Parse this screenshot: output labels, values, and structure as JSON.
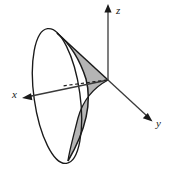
{
  "figure": {
    "background_color": "#ffffff",
    "stroke_color": "#1a1a1a",
    "shade_fill_color": "#b5b5b5",
    "axes": [
      {
        "id": "z",
        "label": "z",
        "direction": "up",
        "origin": [
          108,
          80
        ],
        "tip": [
          108,
          6
        ],
        "arrowhead": true
      },
      {
        "id": "x",
        "label": "x",
        "direction": "down-left",
        "origin": [
          108,
          80
        ],
        "tip": [
          23,
          98
        ],
        "arrowhead": true
      },
      {
        "id": "y",
        "label": "y",
        "direction": "down-right",
        "origin": [
          108,
          80
        ],
        "tip": [
          152,
          121
        ],
        "arrowhead": true
      }
    ],
    "cone": {
      "apex": [
        108,
        80
      ],
      "base_ellipse": {
        "center": [
          57,
          96
        ],
        "radius_x": 23,
        "radius_y": 68,
        "rotation_deg": -8
      },
      "upper_edge_from": [
        57,
        33
      ],
      "lower_edge_from": [
        64,
        162
      ]
    },
    "shaded_region": {
      "filled": true,
      "vertices_note": "apex at origin, upper vertex near top of ellipse, lower cusp near bottom of cone"
    },
    "dashed_line": {
      "from": [
        108,
        80
      ],
      "to": [
        62,
        86
      ],
      "style": "dashed"
    }
  }
}
